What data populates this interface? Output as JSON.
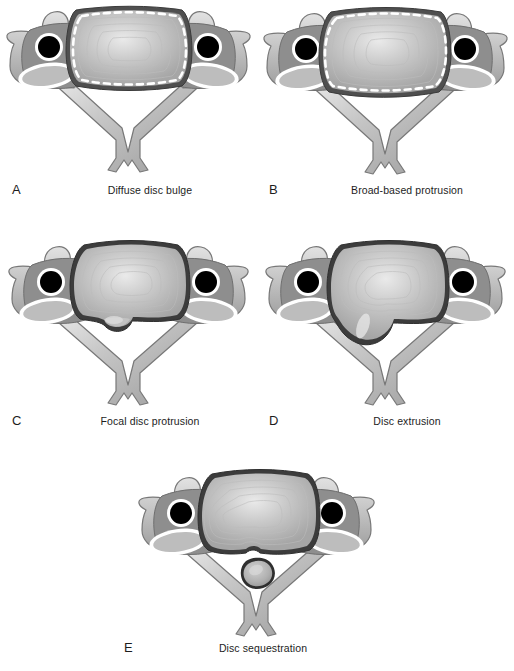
{
  "figure": {
    "background_color": "#ffffff",
    "panel_count": 5
  },
  "palette": {
    "background": "#ffffff",
    "bone_light": "#d8d8d8",
    "bone_mid": "#b4b4b4",
    "bone_dark": "#8f8f8f",
    "bone_outline": "#6b6b6b",
    "body_fill": "#9a9a9a",
    "foramen_black": "#000000",
    "foramen_ring": "#ffffff",
    "facet_fill": "#b9b9b9",
    "facet_rim": "#ffffff",
    "disc_rim_dark": "#4a4a4a",
    "disc_annulus": "#a9a9a9",
    "disc_nucleus": "#e6e6e6",
    "dashed_marker": "#ffffff",
    "caption_text": "#1d1d1d"
  },
  "panels": [
    {
      "id": "a",
      "letter": "A",
      "label": "Diffuse disc bulge",
      "morphology": "symmetric circumferential bulge beyond vertebral margin, dashed outline marks original disc border",
      "has_dashed_outline": true,
      "herniation_shape": "none"
    },
    {
      "id": "b",
      "letter": "B",
      "label": "Broad-based protrusion",
      "morphology": "asymmetric wide-based posterior displacement, dashed outline marks original disc border",
      "has_dashed_outline": true,
      "herniation_shape": "broad"
    },
    {
      "id": "c",
      "letter": "C",
      "label": "Focal disc protrusion",
      "morphology": "small localized posterior bump, base wider than dome",
      "has_dashed_outline": false,
      "herniation_shape": "focal-bump"
    },
    {
      "id": "d",
      "letter": "D",
      "label": "Disc extrusion",
      "morphology": "large posterolateral lobe with narrow neck, dome wider than base",
      "has_dashed_outline": false,
      "herniation_shape": "extrusion-lobe"
    },
    {
      "id": "e",
      "letter": "E",
      "label": "Disc sequestration",
      "morphology": "free fragment detached from parent disc within canal",
      "has_dashed_outline": false,
      "herniation_shape": "free-fragment"
    }
  ],
  "anatomy_parts": [
    "vertebral-body",
    "intervertebral-disc",
    "annulus-fibrosus-lamellae",
    "nucleus-pulposus",
    "transverse-foramen",
    "transverse-process",
    "superior-articular-facet",
    "pedicle",
    "lamina",
    "bifid-spinous-process",
    "vertebral-canal"
  ]
}
